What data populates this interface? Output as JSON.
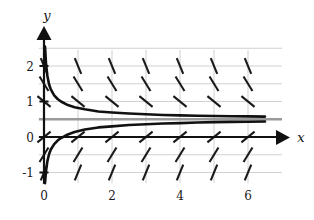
{
  "figure": {
    "kind": "slope-field-with-solution-curves",
    "background": "#ffffff",
    "width": 314,
    "height": 220
  },
  "axes": {
    "x_label": "x",
    "y_label": "y",
    "x_ticks": [
      "0",
      "2",
      "4",
      "6"
    ],
    "x_tick_values": [
      0,
      2,
      4,
      6
    ],
    "y_ticks": [
      "2",
      "1",
      "0",
      "-1"
    ],
    "y_tick_values": [
      2,
      1,
      0,
      -1
    ],
    "axis_color": "#111111",
    "grid_color": "#c8c8c8",
    "grid": true
  },
  "colors": {
    "curve": "#111111",
    "slope_mark": "#1a1a1a",
    "equilibrium": "#9a9a9a",
    "grid": "#cccccc",
    "axis": "#111111"
  },
  "chart_data": {
    "type": "line",
    "title": "",
    "xlabel": "x",
    "ylabel": "y",
    "xlim": [
      -0.25,
      7.1
    ],
    "ylim": [
      -1.35,
      2.55
    ],
    "grid": true,
    "legend": "none",
    "x_ticks": [
      0,
      2,
      4,
      6
    ],
    "y_ticks": [
      -1,
      0,
      1,
      2
    ],
    "equilibrium_line": {
      "label": "y = 0.5",
      "y": 0.5,
      "color": "#9a9a9a",
      "style": "solid"
    },
    "series": [
      {
        "name": "upper-solution",
        "comment": "decreasing solution approaching y = 0.5 from above",
        "x": [
          0.03,
          0.06,
          0.1,
          0.15,
          0.2,
          0.3,
          0.4,
          0.5,
          0.7,
          0.9,
          1.2,
          1.6,
          2.0,
          2.5,
          3.0,
          3.5,
          4.0,
          4.5,
          5.0,
          5.5,
          6.0,
          6.5
        ],
        "y": [
          2.55,
          2.05,
          1.72,
          1.48,
          1.34,
          1.17,
          1.07,
          1.0,
          0.9,
          0.84,
          0.78,
          0.72,
          0.69,
          0.66,
          0.64,
          0.62,
          0.61,
          0.6,
          0.59,
          0.585,
          0.58,
          0.575
        ]
      },
      {
        "name": "lower-solution",
        "comment": "increasing solution approaching y = 0.5 from below",
        "x": [
          0.03,
          0.06,
          0.1,
          0.15,
          0.2,
          0.3,
          0.4,
          0.5,
          0.7,
          0.9,
          1.2,
          1.6,
          2.0,
          2.5,
          3.0,
          3.5,
          4.0,
          4.5,
          5.0,
          5.5,
          6.0,
          6.5
        ],
        "y": [
          -1.3,
          -0.95,
          -0.68,
          -0.48,
          -0.35,
          -0.2,
          -0.1,
          -0.03,
          0.07,
          0.14,
          0.21,
          0.27,
          0.3,
          0.34,
          0.36,
          0.38,
          0.39,
          0.41,
          0.42,
          0.425,
          0.43,
          0.435
        ]
      }
    ],
    "slope_field": {
      "description": "short line segments showing dy/dx; negative slopes above y=0.5, positive slopes below y=0.5, magnitude grows with distance from 0.5",
      "x_positions": [
        0.0,
        1.0,
        2.0,
        3.0,
        4.0,
        5.0,
        6.0
      ],
      "y_positions": [
        2.0,
        1.5,
        1.0,
        0.0,
        -0.5,
        -1.0
      ],
      "mark_length": 17
    }
  }
}
